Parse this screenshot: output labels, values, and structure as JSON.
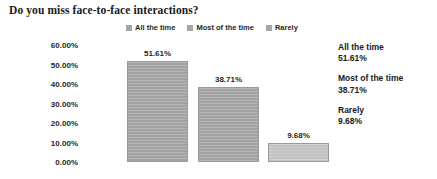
{
  "chart_data": {
    "type": "bar",
    "title": "Do you miss face-to-face interactions?",
    "xlabel": "",
    "ylabel": "",
    "categories": [
      "All the time",
      "Most of the time",
      "Rarely"
    ],
    "values": [
      51.61,
      38.71,
      9.68
    ],
    "value_labels": [
      "51.61%",
      "38.71%",
      "9.68%"
    ],
    "ylim": [
      0,
      60
    ],
    "ytick_values": [
      0,
      10,
      20,
      30,
      40,
      50,
      60
    ],
    "ytick_labels": [
      "0.00%",
      "10.00%",
      "20.00%",
      "30.00%",
      "40.00%",
      "50.00%",
      "60.00%"
    ],
    "grid": false,
    "legend_position": "top-center",
    "legend": [
      {
        "label": "All the time",
        "color": "#a6a6a6"
      },
      {
        "label": "Most of the time",
        "color": "#a6a6a6"
      },
      {
        "label": "Rarely",
        "color": "#a6a6a6"
      }
    ],
    "bar_colors": [
      "#a8a8a8",
      "#a8a8a8",
      "#c9c9c9"
    ],
    "background_color": "#ffffff",
    "text_color": "#1a1a1a"
  },
  "summary": {
    "items": [
      {
        "name": "All the time",
        "value": "51.61%"
      },
      {
        "name": "Most of the time",
        "value": "38.71%"
      },
      {
        "name": "Rarely",
        "value": "9.68%"
      }
    ]
  }
}
